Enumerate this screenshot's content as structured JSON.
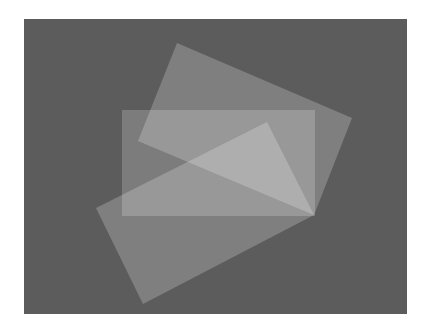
{
  "figure": {
    "width": 429,
    "height": 334,
    "page_background": "#ffffff",
    "canvas": {
      "x": 24,
      "y": 19,
      "width": 383,
      "height": 295,
      "fill": "#5c5c5c"
    },
    "shapes": [
      {
        "name": "top-tilted-rectangle",
        "points": "177,43 352,118 314,215 138,141",
        "fill": "#ffffff",
        "opacity": 0.22
      },
      {
        "name": "center-axis-aligned-rectangle",
        "points": "122,110 315,110 315,216 122,216",
        "fill": "#ffffff",
        "opacity": 0.2
      },
      {
        "name": "bottom-tilted-rectangle",
        "points": "96,208 267,122 314,215 143,304",
        "fill": "#ffffff",
        "opacity": 0.22
      }
    ]
  }
}
